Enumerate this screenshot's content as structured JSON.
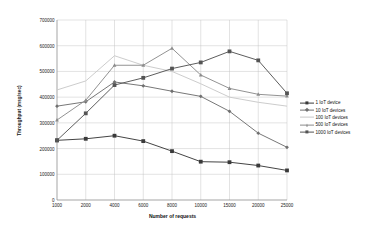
{
  "chart_data": {
    "type": "line",
    "title": "",
    "xlabel": "Number of requests",
    "ylabel": "Throughput (msg/sec)",
    "categories": [
      "1000",
      "2000",
      "4000",
      "6000",
      "8000",
      "10000",
      "15000",
      "20000",
      "25000"
    ],
    "ylim": [
      0,
      700000
    ],
    "ytick_labels": [
      "0",
      "100000",
      "200000",
      "300000",
      "400000",
      "500000",
      "600000",
      "700000"
    ],
    "ytick_values": [
      0,
      100000,
      200000,
      300000,
      400000,
      500000,
      600000,
      700000
    ],
    "grid": true,
    "legend_position": "right",
    "series": [
      {
        "name": "1 IoT device",
        "color": "#3a3a3a",
        "marker": "square",
        "values": [
          232000,
          238000,
          250000,
          229000,
          190000,
          149000,
          147000,
          134000,
          115000
        ]
      },
      {
        "name": "10 IoT devices",
        "color": "#707070",
        "marker": "diamond",
        "values": [
          365000,
          382000,
          459000,
          444000,
          423000,
          403000,
          345000,
          260000,
          205000
        ]
      },
      {
        "name": "100 IoT devices",
        "color": "#c9c9c9",
        "marker": "none",
        "values": [
          428000,
          463000,
          561000,
          524000,
          500000,
          452000,
          400000,
          380000,
          365000
        ]
      },
      {
        "name": "500 IoT devices",
        "color": "#8c8c8c",
        "marker": "triangle",
        "values": [
          311000,
          388000,
          524000,
          524000,
          590000,
          486000,
          434000,
          411000,
          404000
        ]
      },
      {
        "name": "1000 IoT devices",
        "color": "#545454",
        "marker": "square",
        "values": [
          232000,
          337000,
          447000,
          475000,
          511000,
          535000,
          578000,
          543000,
          415000
        ]
      }
    ]
  }
}
